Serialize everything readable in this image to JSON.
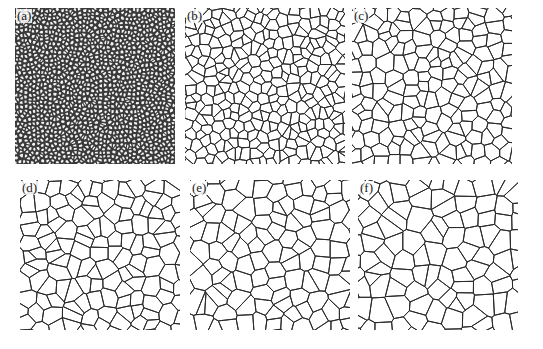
{
  "figure": {
    "panels": [
      {
        "id": "a",
        "label": "(a)",
        "x": 15,
        "y": 8,
        "w": 160,
        "h": 156,
        "cell_size": 4.2,
        "dark": true
      },
      {
        "id": "b",
        "label": "(b)",
        "x": 185,
        "y": 8,
        "w": 160,
        "h": 156,
        "cell_size": 9.5,
        "dark": false
      },
      {
        "id": "c",
        "label": "(c)",
        "x": 352,
        "y": 8,
        "w": 160,
        "h": 156,
        "cell_size": 12.5,
        "dark": false
      },
      {
        "id": "d",
        "label": "(d)",
        "x": 20,
        "y": 180,
        "w": 160,
        "h": 150,
        "cell_size": 14,
        "dark": false
      },
      {
        "id": "e",
        "label": "(e)",
        "x": 190,
        "y": 180,
        "w": 160,
        "h": 150,
        "cell_size": 15.5,
        "dark": false
      },
      {
        "id": "f",
        "label": "(f)",
        "x": 358,
        "y": 180,
        "w": 160,
        "h": 150,
        "cell_size": 17,
        "dark": false
      }
    ],
    "colors": {
      "line": "#2a2a2a",
      "background": "#ffffff",
      "dark_fill": "#3a3a3a",
      "grain_fill": "#f4f4f4"
    }
  }
}
